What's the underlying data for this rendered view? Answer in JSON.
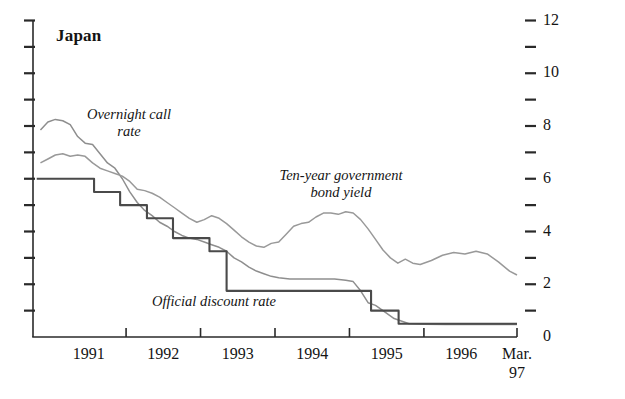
{
  "chart_data": {
    "type": "line",
    "title": "Japan",
    "xlabel": "",
    "ylabel": "",
    "grid": false,
    "legend_position": "inline-annotations",
    "xlim": [
      1990.75,
      1997.25
    ],
    "ylim": [
      0,
      12
    ],
    "y_axis": {
      "side": "both",
      "labeled_side": "right",
      "ticks": [
        0,
        1,
        2,
        3,
        4,
        5,
        6,
        7,
        8,
        9,
        10,
        11,
        12
      ],
      "tick_labels": [
        "0",
        "",
        "2",
        "",
        "4",
        "",
        "6",
        "",
        "8",
        "",
        "10",
        "",
        "12"
      ],
      "labeled_ticks": [
        0,
        2,
        4,
        6,
        8,
        10,
        12
      ]
    },
    "x_axis": {
      "tick_positions": [
        1991,
        1992,
        1993,
        1994,
        1995,
        1996,
        1997.25
      ],
      "tick_labels": [
        "1991",
        "1992",
        "1993",
        "1994",
        "1995",
        "1996",
        "Mar.\n97"
      ],
      "tick_label_offsets": [
        1991.5,
        1992.5,
        1993.5,
        1994.5,
        1995.5,
        1996.5,
        1997.25
      ]
    },
    "annotations": [
      {
        "name": "overnight-call-rate",
        "text": "Overnight call\nrate"
      },
      {
        "name": "ten-year-bond-yield",
        "text": "Ten-year government\nbond yield"
      },
      {
        "name": "official-discount-rate",
        "text": "Official discount rate"
      }
    ],
    "series": [
      {
        "name": "Overnight call rate",
        "color": "#8e8e8e",
        "style": "solid",
        "x": [
          1990.85,
          1990.95,
          1991.05,
          1991.15,
          1991.25,
          1991.35,
          1991.45,
          1991.55,
          1991.65,
          1991.75,
          1991.85,
          1991.95,
          1992.05,
          1992.15,
          1992.25,
          1992.35,
          1992.45,
          1992.55,
          1992.65,
          1992.75,
          1992.85,
          1992.95,
          1993.05,
          1993.15,
          1993.25,
          1993.35,
          1993.45,
          1993.55,
          1993.65,
          1993.75,
          1993.85,
          1993.95,
          1994.05,
          1994.2,
          1994.4,
          1994.6,
          1994.8,
          1994.95,
          1995.05,
          1995.15,
          1995.25,
          1995.35,
          1995.45,
          1995.6,
          1995.8,
          1996.0,
          1996.3,
          1996.6,
          1997.0,
          1997.25
        ],
        "y": [
          7.85,
          8.15,
          8.25,
          8.2,
          8.05,
          7.6,
          7.35,
          7.3,
          6.95,
          6.6,
          6.4,
          6.0,
          5.5,
          5.1,
          4.8,
          4.6,
          4.35,
          4.2,
          4.0,
          3.85,
          3.75,
          3.7,
          3.6,
          3.5,
          3.4,
          3.25,
          3.0,
          2.85,
          2.65,
          2.5,
          2.4,
          2.3,
          2.25,
          2.2,
          2.2,
          2.2,
          2.2,
          2.15,
          2.1,
          1.75,
          1.3,
          1.2,
          1.0,
          0.7,
          0.5,
          0.48,
          0.47,
          0.47,
          0.47,
          0.47
        ]
      },
      {
        "name": "Ten-year government bond yield",
        "color": "#999999",
        "style": "solid",
        "x": [
          1990.85,
          1990.95,
          1991.05,
          1991.15,
          1991.25,
          1991.35,
          1991.45,
          1991.55,
          1991.65,
          1991.75,
          1991.85,
          1991.95,
          1992.05,
          1992.15,
          1992.25,
          1992.35,
          1992.45,
          1992.55,
          1992.65,
          1992.75,
          1992.85,
          1992.95,
          1993.05,
          1993.15,
          1993.25,
          1993.35,
          1993.45,
          1993.55,
          1993.65,
          1993.75,
          1993.85,
          1993.95,
          1994.05,
          1994.15,
          1994.25,
          1994.35,
          1994.45,
          1994.55,
          1994.65,
          1994.75,
          1994.85,
          1994.95,
          1995.05,
          1995.15,
          1995.25,
          1995.35,
          1995.45,
          1995.55,
          1995.65,
          1995.75,
          1995.85,
          1995.95,
          1996.1,
          1996.25,
          1996.4,
          1996.55,
          1996.7,
          1996.85,
          1997.0,
          1997.15,
          1997.25
        ],
        "y": [
          6.6,
          6.75,
          6.9,
          6.95,
          6.85,
          6.9,
          6.85,
          6.6,
          6.4,
          6.3,
          6.2,
          6.1,
          5.9,
          5.6,
          5.55,
          5.45,
          5.3,
          5.1,
          4.9,
          4.7,
          4.5,
          4.35,
          4.45,
          4.6,
          4.5,
          4.3,
          4.05,
          3.8,
          3.6,
          3.45,
          3.4,
          3.55,
          3.6,
          3.9,
          4.2,
          4.3,
          4.35,
          4.55,
          4.7,
          4.7,
          4.65,
          4.75,
          4.7,
          4.45,
          4.1,
          3.7,
          3.3,
          3.0,
          2.8,
          2.95,
          2.8,
          2.75,
          2.9,
          3.1,
          3.2,
          3.15,
          3.25,
          3.15,
          2.85,
          2.5,
          2.35
        ]
      },
      {
        "name": "Official discount rate",
        "color": "#4a4a4a",
        "style": "step",
        "x": [
          1990.8,
          1991.57,
          1991.57,
          1991.92,
          1991.92,
          1992.28,
          1992.28,
          1992.63,
          1992.63,
          1993.12,
          1993.12,
          1993.35,
          1993.35,
          1994.82,
          1994.82,
          1995.29,
          1995.29,
          1995.66,
          1995.66,
          1997.25
        ],
        "y": [
          6.0,
          6.0,
          5.5,
          5.5,
          5.0,
          5.0,
          4.5,
          4.5,
          3.75,
          3.75,
          3.25,
          3.25,
          1.75,
          1.75,
          1.75,
          1.75,
          1.0,
          1.0,
          0.5,
          0.5
        ]
      }
    ]
  }
}
